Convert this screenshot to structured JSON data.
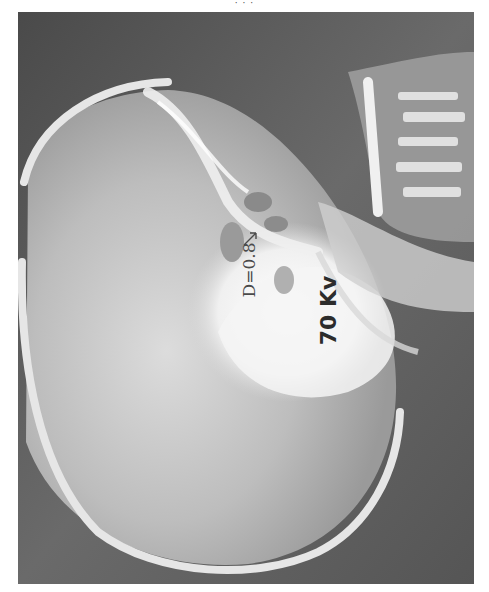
{
  "page": {
    "header_text": "· · ·"
  },
  "radiograph": {
    "subject": "lateral skull radiograph",
    "annotations": {
      "density": "D=0.8",
      "voltage": "70 Kv"
    },
    "colors": {
      "background": "#5e5e5e",
      "bone": "#f2f2f2",
      "text": "#2c2c2c"
    }
  }
}
